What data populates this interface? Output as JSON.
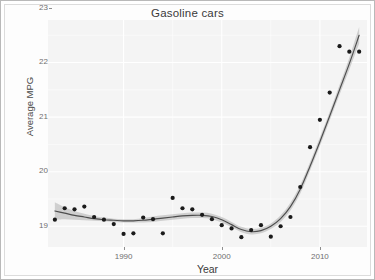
{
  "chart_data": {
    "type": "scatter",
    "title": "Gasoline cars",
    "xlabel": "Year",
    "ylabel": "Average MPG",
    "xlim": [
      1982.3,
      2014.8
    ],
    "ylim": [
      18.62,
      22.78
    ],
    "xticks": [
      1990,
      2000,
      2010
    ],
    "xticklabels": [
      "1990",
      "2000",
      "2010"
    ],
    "yticks": [
      19,
      20,
      21,
      22,
      23
    ],
    "yticklabels": [
      "19",
      "20",
      "21",
      "22",
      "23"
    ],
    "grid": true,
    "legend": "none",
    "panel_background": "#f4f4f4",
    "gridline_color": "#ffffff",
    "point_color": "#1a1a1a",
    "line_color": "#4d4d4d",
    "ribbon_color": "#9a9a9a",
    "series": [
      {
        "name": "Average MPG",
        "kind": "points",
        "x": [
          1983,
          1984,
          1985,
          1986,
          1987,
          1988,
          1989,
          1990,
          1991,
          1992,
          1993,
          1994,
          1995,
          1996,
          1997,
          1998,
          1999,
          2000,
          2001,
          2002,
          2003,
          2004,
          2005,
          2006,
          2007,
          2008,
          2009,
          2010,
          2011,
          2012,
          2013,
          2014
        ],
        "y": [
          19.12,
          19.33,
          19.31,
          19.36,
          19.17,
          19.12,
          19.04,
          18.86,
          18.87,
          19.16,
          19.13,
          18.87,
          19.52,
          19.33,
          19.31,
          19.21,
          19.13,
          19.02,
          18.96,
          18.8,
          18.93,
          19.02,
          18.81,
          19.0,
          19.17,
          19.72,
          20.45,
          20.95,
          21.45,
          22.3,
          22.2,
          22.2
        ]
      },
      {
        "name": "LOESS smooth",
        "kind": "line",
        "x": [
          1983,
          1984,
          1985,
          1986,
          1987,
          1988,
          1989,
          1990,
          1991,
          1992,
          1993,
          1994,
          1995,
          1996,
          1997,
          1998,
          1999,
          2000,
          2001,
          2002,
          2003,
          2004,
          2005,
          2006,
          2007,
          2008,
          2009,
          2010,
          2011,
          2012,
          2013,
          2014
        ],
        "y": [
          19.28,
          19.24,
          19.2,
          19.17,
          19.14,
          19.12,
          19.11,
          19.1,
          19.1,
          19.11,
          19.13,
          19.15,
          19.17,
          19.19,
          19.2,
          19.2,
          19.18,
          19.12,
          19.03,
          18.94,
          18.9,
          18.92,
          19.0,
          19.14,
          19.36,
          19.68,
          20.1,
          20.55,
          21.02,
          21.5,
          21.98,
          22.5
        ],
        "ci_lower": [
          19.12,
          19.13,
          19.12,
          19.11,
          19.1,
          19.09,
          19.08,
          19.07,
          19.07,
          19.07,
          19.08,
          19.1,
          19.12,
          19.14,
          19.15,
          19.15,
          19.13,
          19.07,
          18.98,
          18.89,
          18.85,
          18.87,
          18.95,
          19.08,
          19.29,
          19.6,
          20.02,
          20.47,
          20.94,
          21.41,
          21.87,
          22.35
        ],
        "ci_upper": [
          19.44,
          19.35,
          19.28,
          19.23,
          19.19,
          19.16,
          19.14,
          19.13,
          19.13,
          19.15,
          19.18,
          19.2,
          19.22,
          19.24,
          19.25,
          19.25,
          19.23,
          19.17,
          19.08,
          18.99,
          18.95,
          18.97,
          19.05,
          19.2,
          19.43,
          19.76,
          20.18,
          20.63,
          21.1,
          21.59,
          22.09,
          22.65
        ]
      }
    ]
  }
}
